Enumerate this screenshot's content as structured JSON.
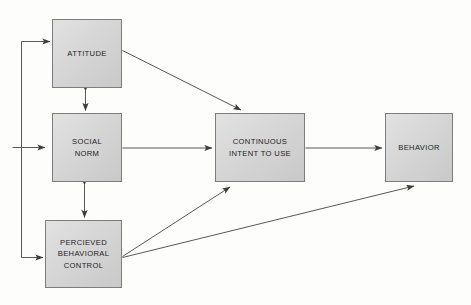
{
  "diagram": {
    "type": "flow",
    "background_color": "#fdfdfc",
    "node_fill_color": "#d6d6d6",
    "node_border_color": "#7d7d7d",
    "edge_color": "#4a4a4a",
    "nodes": [
      {
        "id": "attitude",
        "label": "ATTITUDE",
        "lines": [
          "ATTITUDE"
        ]
      },
      {
        "id": "social_norm",
        "label": "SOCIAL NORM",
        "lines": [
          "SOCIAL",
          "NORM"
        ]
      },
      {
        "id": "perceived_behavioral_control",
        "label": "PERCIEVED BEHAVIORAL CONTROL",
        "lines": [
          "PERCIEVED",
          "BEHAVIORAL",
          "CONTROL"
        ]
      },
      {
        "id": "continuous_intent",
        "label": "CONTINUOUS INTENT TO USE",
        "lines": [
          "CONTINUOUS",
          "INTENT TO USE"
        ]
      },
      {
        "id": "behavior",
        "label": "BEHAVIOR",
        "lines": [
          "BEHAVIOR"
        ]
      }
    ],
    "edges": [
      {
        "from": "external",
        "to": "attitude",
        "style": "elbow",
        "arrow": "single"
      },
      {
        "from": "external",
        "to": "social_norm",
        "style": "straight",
        "arrow": "single"
      },
      {
        "from": "external",
        "to": "perceived_behavioral_control",
        "style": "elbow",
        "arrow": "single"
      },
      {
        "from": "attitude",
        "to": "social_norm",
        "style": "straight",
        "arrow": "double"
      },
      {
        "from": "social_norm",
        "to": "perceived_behavioral_control",
        "style": "straight",
        "arrow": "double"
      },
      {
        "from": "attitude",
        "to": "continuous_intent",
        "style": "diagonal",
        "arrow": "single"
      },
      {
        "from": "social_norm",
        "to": "continuous_intent",
        "style": "straight",
        "arrow": "single"
      },
      {
        "from": "perceived_behavioral_control",
        "to": "continuous_intent",
        "style": "diagonal",
        "arrow": "single"
      },
      {
        "from": "continuous_intent",
        "to": "behavior",
        "style": "straight",
        "arrow": "single"
      },
      {
        "from": "perceived_behavioral_control",
        "to": "behavior",
        "style": "diagonal",
        "arrow": "single"
      }
    ]
  }
}
